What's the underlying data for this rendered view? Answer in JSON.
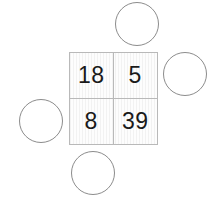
{
  "canvas": {
    "width": 223,
    "height": 208,
    "background": "#ffffff"
  },
  "grid": {
    "name": "number-grid",
    "rows": 2,
    "columns": 2,
    "x": 69,
    "y": 52,
    "width": 89,
    "height": 93,
    "border_color": "#b9b9b9",
    "fill_color": "#fbfbfb",
    "text_color": "#1a1a1a",
    "cells": [
      {
        "id": "cell-top-left",
        "value": "18",
        "row": 0,
        "col": 0
      },
      {
        "id": "cell-top-right",
        "value": "5",
        "row": 0,
        "col": 1
      },
      {
        "id": "cell-bottom-left",
        "value": "8",
        "row": 1,
        "col": 0
      },
      {
        "id": "cell-bottom-right",
        "value": "39",
        "row": 1,
        "col": 1
      }
    ]
  },
  "circles": [
    {
      "id": "circle-top",
      "position": "top",
      "x": 115,
      "y": 2,
      "diameter": 44,
      "stroke": "#8c8c8c",
      "stroke_width": 1,
      "fill": "#ffffff"
    },
    {
      "id": "circle-right",
      "position": "right",
      "x": 163,
      "y": 52,
      "diameter": 44,
      "stroke": "#8c8c8c",
      "stroke_width": 1,
      "fill": "#ffffff"
    },
    {
      "id": "circle-left",
      "position": "left",
      "x": 19,
      "y": 99,
      "diameter": 44,
      "stroke": "#8c8c8c",
      "stroke_width": 1,
      "fill": "#ffffff"
    },
    {
      "id": "circle-bottom",
      "position": "bottom",
      "x": 71,
      "y": 151,
      "diameter": 44,
      "stroke": "#8c8c8c",
      "stroke_width": 1,
      "fill": "#ffffff"
    }
  ]
}
